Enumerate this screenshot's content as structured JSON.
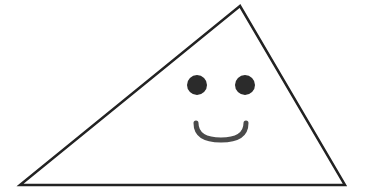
{
  "illustration": {
    "subject": "smiling triangle",
    "colors": {
      "background": "#ffffff",
      "outline": "#222222",
      "eyes": "#2b2b2b",
      "mouth": "#4a4a4a"
    },
    "triangle": {
      "points": "240,6 20,185 345,185",
      "stroke_width": 2.5
    },
    "left_eye": {
      "cx": 197,
      "cy": 85,
      "r": 10
    },
    "right_eye": {
      "cx": 245,
      "cy": 85,
      "r": 10
    },
    "mouth": {
      "path": "M196,123 Q196,140 221,140 Q246,140 246,123",
      "stroke_width": 5
    }
  }
}
